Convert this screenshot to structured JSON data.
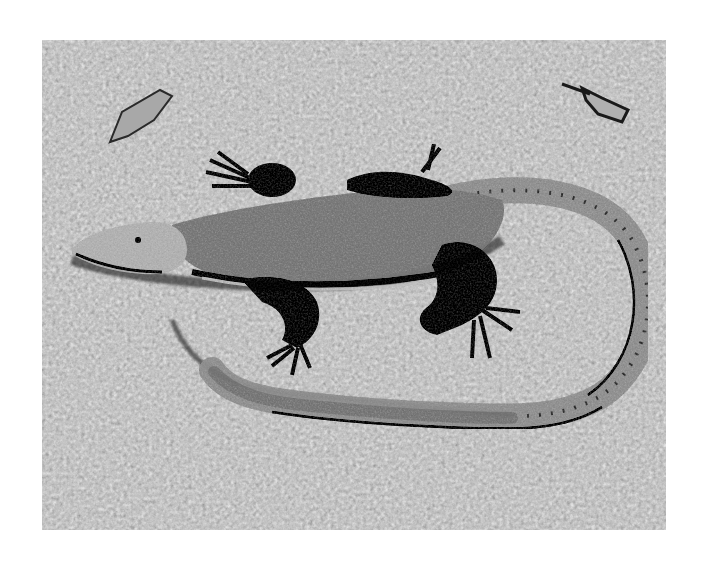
{
  "image": {
    "kind": "photograph",
    "tone": "grayscale",
    "subject": "lizard",
    "setting": "gravel ground",
    "description": "Top-down black-and-white photograph of a lizard lying on gravel with its long tail curving around to the right and back toward its head; two dead leaves visible in the upper corners.",
    "colors": {
      "background_page": "#ffffff",
      "gravel_mid": "#7a7a7a",
      "gravel_light": "#b8b8b8",
      "gravel_dark": "#3a3a3a",
      "body_mid": "#8e8e8e",
      "limbs_dark": "#1e1e1e",
      "head_light": "#c4c4c4",
      "tail_light": "#a6a6a6"
    }
  }
}
